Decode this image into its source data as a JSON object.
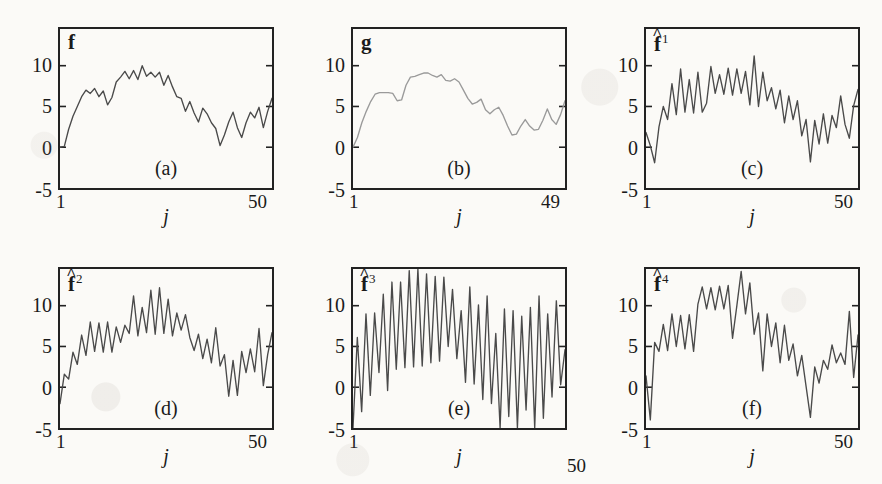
{
  "figure": {
    "layout": "2 rows x 3 columns",
    "y_axis": {
      "ticks": [
        "10",
        "5",
        "0",
        "-5"
      ],
      "tick_values": [
        10,
        5,
        0,
        -5
      ],
      "min": -5,
      "max": 14.5
    },
    "x_axis": {
      "name": "j",
      "start_label": "1",
      "end_label": "50"
    },
    "line_color_default": "#4a4a4a",
    "line_color_smooth": "#9a9a9a",
    "frame_color": "#222222",
    "background": "#fbfaf7"
  },
  "chart_data": [
    {
      "type": "line",
      "panel": "a",
      "caption": "(a)",
      "title": "f",
      "title_kind": "plain",
      "title_superscript": "",
      "xlabel": "j",
      "ylabel": "",
      "xlim": [
        1,
        50
      ],
      "ylim": [
        -5,
        14.5
      ],
      "yticks": [
        -5,
        0,
        5,
        10
      ],
      "xtick_labels": [
        "1",
        "50"
      ],
      "grid": false,
      "legend": "none",
      "line_color": "#4a4a4a",
      "x": [
        1,
        2,
        3,
        4,
        5,
        6,
        7,
        8,
        9,
        10,
        11,
        12,
        13,
        14,
        15,
        16,
        17,
        18,
        19,
        20,
        21,
        22,
        23,
        24,
        25,
        26,
        27,
        28,
        29,
        30,
        31,
        32,
        33,
        34,
        35,
        36,
        37,
        38,
        39,
        40,
        41,
        42,
        43,
        44,
        45,
        46,
        47,
        48,
        49,
        50
      ],
      "values": [
        0.0,
        0.1,
        2.2,
        3.8,
        5.0,
        6.2,
        7.0,
        6.6,
        7.2,
        6.2,
        6.9,
        5.2,
        6.1,
        8.0,
        8.6,
        9.3,
        8.4,
        9.4,
        8.3,
        10.0,
        8.7,
        9.2,
        8.6,
        9.2,
        7.6,
        8.8,
        7.4,
        6.2,
        6.0,
        4.4,
        5.6,
        4.2,
        3.1,
        4.8,
        4.1,
        3.0,
        2.3,
        0.2,
        1.5,
        3.1,
        4.3,
        2.4,
        1.2,
        3.0,
        4.3,
        3.6,
        4.9,
        2.4,
        4.4,
        6.0
      ]
    },
    {
      "type": "line",
      "panel": "b",
      "caption": "(b)",
      "title": "g",
      "title_kind": "plain",
      "title_superscript": "",
      "xlabel": "j",
      "ylabel": "",
      "xlim": [
        1,
        49
      ],
      "ylim": [
        -5,
        14.5
      ],
      "yticks": [
        -5,
        0,
        5,
        10
      ],
      "xtick_labels": [
        "1",
        "49"
      ],
      "grid": false,
      "legend": "none",
      "line_color": "#9a9a9a",
      "x": [
        1,
        2,
        3,
        4,
        5,
        6,
        7,
        8,
        9,
        10,
        11,
        12,
        13,
        14,
        15,
        16,
        17,
        18,
        19,
        20,
        21,
        22,
        23,
        24,
        25,
        26,
        27,
        28,
        29,
        30,
        31,
        32,
        33,
        34,
        35,
        36,
        37,
        38,
        39,
        40,
        41,
        42,
        43,
        44,
        45,
        46,
        47,
        48,
        49
      ],
      "values": [
        0.0,
        1.2,
        3.0,
        4.4,
        5.6,
        6.5,
        6.7,
        6.7,
        6.7,
        6.6,
        5.7,
        5.8,
        7.6,
        8.6,
        8.7,
        8.9,
        9.1,
        9.1,
        8.8,
        8.6,
        8.9,
        8.2,
        8.1,
        8.4,
        8.0,
        7.0,
        6.0,
        5.3,
        5.5,
        5.9,
        4.6,
        4.1,
        4.6,
        4.9,
        3.9,
        2.6,
        1.5,
        1.6,
        2.6,
        3.4,
        2.6,
        2.1,
        2.2,
        3.3,
        4.7,
        3.4,
        2.8,
        4.0,
        5.7
      ]
    },
    {
      "type": "line",
      "panel": "c",
      "caption": "(c)",
      "title": "f",
      "title_kind": "hat",
      "title_superscript": "1",
      "xlabel": "j",
      "ylabel": "",
      "xlim": [
        1,
        50
      ],
      "ylim": [
        -5,
        14.5
      ],
      "yticks": [
        -5,
        0,
        5,
        10
      ],
      "xtick_labels": [
        "1",
        "50"
      ],
      "grid": false,
      "legend": "none",
      "line_color": "#4a4a4a",
      "x": [
        1,
        2,
        3,
        4,
        5,
        6,
        7,
        8,
        9,
        10,
        11,
        12,
        13,
        14,
        15,
        16,
        17,
        18,
        19,
        20,
        21,
        22,
        23,
        24,
        25,
        26,
        27,
        28,
        29,
        30,
        31,
        32,
        33,
        34,
        35,
        36,
        37,
        38,
        39,
        40,
        41,
        42,
        43,
        44,
        45,
        46,
        47,
        48,
        49,
        50
      ],
      "values": [
        1.8,
        0.2,
        -1.9,
        2.5,
        5.0,
        3.4,
        7.8,
        4.0,
        9.6,
        4.3,
        8.3,
        4.2,
        9.2,
        4.3,
        5.4,
        9.9,
        6.6,
        8.9,
        6.5,
        9.7,
        6.4,
        9.6,
        6.6,
        9.3,
        5.2,
        11.2,
        5.0,
        9.2,
        5.7,
        7.3,
        4.7,
        7.0,
        3.0,
        6.3,
        3.4,
        5.7,
        1.4,
        3.4,
        -1.8,
        3.3,
        0.4,
        4.1,
        0.5,
        3.9,
        2.4,
        6.3,
        2.8,
        1.1,
        5.1,
        7.1
      ]
    },
    {
      "type": "line",
      "panel": "d",
      "caption": "(d)",
      "title": "f",
      "title_kind": "hat",
      "title_superscript": "2",
      "xlabel": "j",
      "ylabel": "",
      "xlim": [
        1,
        50
      ],
      "ylim": [
        -5,
        14.5
      ],
      "yticks": [
        -5,
        0,
        5,
        10
      ],
      "xtick_labels": [
        "1",
        "50"
      ],
      "grid": false,
      "legend": "none",
      "line_color": "#4a4a4a",
      "x": [
        1,
        2,
        3,
        4,
        5,
        6,
        7,
        8,
        9,
        10,
        11,
        12,
        13,
        14,
        15,
        16,
        17,
        18,
        19,
        20,
        21,
        22,
        23,
        24,
        25,
        26,
        27,
        28,
        29,
        30,
        31,
        32,
        33,
        34,
        35,
        36,
        37,
        38,
        39,
        40,
        41,
        42,
        43,
        44,
        45,
        46,
        47,
        48,
        49,
        50
      ],
      "values": [
        -2.0,
        1.6,
        1.0,
        4.3,
        2.8,
        6.4,
        3.9,
        8.0,
        4.4,
        7.9,
        4.3,
        8.0,
        4.3,
        7.4,
        5.5,
        7.6,
        6.6,
        11.2,
        6.3,
        9.8,
        6.7,
        11.9,
        6.5,
        12.2,
        6.6,
        10.8,
        6.3,
        9.1,
        7.0,
        8.9,
        6.1,
        4.5,
        6.5,
        3.5,
        5.9,
        3.0,
        7.3,
        2.6,
        4.0,
        -1.1,
        3.3,
        -1.0,
        4.4,
        1.8,
        4.7,
        1.9,
        7.2,
        0.2,
        4.0,
        6.7
      ]
    },
    {
      "type": "line",
      "panel": "e",
      "caption": "(e)",
      "title": "f",
      "title_kind": "hat",
      "title_superscript": "3",
      "xlabel": "j",
      "ylabel": "",
      "xlim": [
        1,
        50
      ],
      "ylim": [
        -5,
        14.5
      ],
      "yticks": [
        -5,
        0,
        5,
        10
      ],
      "xtick_labels": [
        "1",
        "50"
      ],
      "xtick_end_offset": true,
      "grid": false,
      "legend": "none",
      "line_color": "#4a4a4a",
      "x": [
        1,
        2,
        3,
        4,
        5,
        6,
        7,
        8,
        9,
        10,
        11,
        12,
        13,
        14,
        15,
        16,
        17,
        18,
        19,
        20,
        21,
        22,
        23,
        24,
        25,
        26,
        27,
        28,
        29,
        30,
        31,
        32,
        33,
        34,
        35,
        36,
        37,
        38,
        39,
        40,
        41,
        42,
        43,
        44,
        45,
        46,
        47,
        48,
        49,
        50
      ],
      "values": [
        -5.0,
        6.1,
        -3.0,
        9.0,
        -1.0,
        9.1,
        1.8,
        11.4,
        -0.4,
        12.9,
        2.2,
        12.9,
        2.4,
        14.3,
        2.5,
        15.4,
        2.6,
        13.9,
        3.0,
        13.6,
        3.2,
        13.5,
        5.0,
        12.0,
        3.5,
        9.4,
        0.6,
        12.3,
        0.4,
        10.1,
        -1.5,
        11.2,
        -2.0,
        6.6,
        -5.0,
        9.6,
        -3.6,
        9.4,
        -5.0,
        8.7,
        -2.8,
        9.8,
        -5.0,
        11.2,
        -3.8,
        9.0,
        -1.2,
        10.6,
        0.3,
        4.6
      ]
    },
    {
      "type": "line",
      "panel": "f",
      "caption": "(f)",
      "title": "f",
      "title_kind": "hat",
      "title_superscript": "4",
      "xlabel": "j",
      "ylabel": "",
      "xlim": [
        1,
        50
      ],
      "ylim": [
        -5,
        14.5
      ],
      "yticks": [
        -5,
        0,
        5,
        10
      ],
      "xtick_labels": [
        "1",
        "50"
      ],
      "grid": false,
      "legend": "none",
      "line_color": "#4a4a4a",
      "x": [
        1,
        2,
        3,
        4,
        5,
        6,
        7,
        8,
        9,
        10,
        11,
        12,
        13,
        14,
        15,
        16,
        17,
        18,
        19,
        20,
        21,
        22,
        23,
        24,
        25,
        26,
        27,
        28,
        29,
        30,
        31,
        32,
        33,
        34,
        35,
        36,
        37,
        38,
        39,
        40,
        41,
        42,
        43,
        44,
        45,
        46,
        47,
        48,
        49,
        50
      ],
      "values": [
        1.4,
        -4.0,
        5.5,
        4.4,
        7.7,
        4.5,
        9.0,
        5.0,
        8.8,
        4.7,
        8.9,
        4.4,
        10.2,
        12.3,
        9.6,
        12.2,
        9.5,
        12.4,
        9.6,
        12.5,
        6.0,
        10.0,
        14.2,
        9.0,
        12.8,
        6.5,
        9.1,
        2.0,
        9.0,
        5.0,
        7.9,
        3.0,
        7.6,
        3.3,
        5.3,
        1.4,
        3.9,
        0.1,
        -3.7,
        2.5,
        0.5,
        3.3,
        2.2,
        5.2,
        3.0,
        4.2,
        2.8,
        9.3,
        1.2,
        6.4
      ]
    }
  ]
}
